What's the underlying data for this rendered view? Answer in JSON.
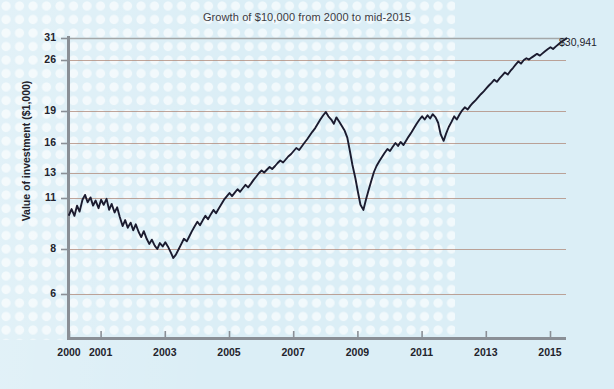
{
  "chart_data": {
    "type": "line",
    "title": "Growth of $10,000 from 2000 to mid-2015",
    "xlabel": "",
    "ylabel": "Value of investment ($1,000)",
    "grid": true,
    "legend": null,
    "xlim": [
      2000,
      2015.5
    ],
    "ylim": [
      5.2,
      31.5
    ],
    "yticks": [
      31,
      26,
      19,
      16,
      13,
      11,
      8,
      6
    ],
    "ytick_labels": [
      "31",
      "26",
      "19",
      "16",
      "13",
      "11",
      "8",
      "6"
    ],
    "xticks": [
      2000,
      2001,
      2003,
      2005,
      2007,
      2009,
      2011,
      2013,
      2015
    ],
    "xtick_labels": [
      "2000",
      "2001",
      "2003",
      "2005",
      "2007",
      "2009",
      "2011",
      "2013",
      "2015"
    ],
    "annotations": [
      {
        "text": "$30,941",
        "x": 2015.5,
        "y": 30.941
      }
    ],
    "series": [
      {
        "name": "Value of investment",
        "color": "#1b1b2f",
        "x": [
          2000.0,
          2000.08,
          2000.17,
          2000.25,
          2000.33,
          2000.42,
          2000.5,
          2000.58,
          2000.67,
          2000.75,
          2000.83,
          2000.92,
          2001.0,
          2001.08,
          2001.17,
          2001.25,
          2001.33,
          2001.42,
          2001.5,
          2001.58,
          2001.67,
          2001.75,
          2001.83,
          2001.92,
          2002.0,
          2002.08,
          2002.17,
          2002.25,
          2002.33,
          2002.42,
          2002.5,
          2002.58,
          2002.67,
          2002.75,
          2002.83,
          2002.92,
          2003.0,
          2003.08,
          2003.17,
          2003.25,
          2003.33,
          2003.42,
          2003.5,
          2003.58,
          2003.67,
          2003.75,
          2003.83,
          2003.92,
          2004.0,
          2004.08,
          2004.17,
          2004.25,
          2004.33,
          2004.42,
          2004.5,
          2004.58,
          2004.67,
          2004.75,
          2004.83,
          2004.92,
          2005.0,
          2005.08,
          2005.17,
          2005.25,
          2005.33,
          2005.42,
          2005.5,
          2005.58,
          2005.67,
          2005.75,
          2005.83,
          2005.92,
          2006.0,
          2006.08,
          2006.17,
          2006.25,
          2006.33,
          2006.42,
          2006.5,
          2006.58,
          2006.67,
          2006.75,
          2006.83,
          2006.92,
          2007.0,
          2007.08,
          2007.17,
          2007.25,
          2007.33,
          2007.42,
          2007.5,
          2007.58,
          2007.67,
          2007.75,
          2007.83,
          2007.92,
          2008.0,
          2008.08,
          2008.17,
          2008.25,
          2008.33,
          2008.42,
          2008.5,
          2008.58,
          2008.67,
          2008.75,
          2008.83,
          2008.92,
          2009.0,
          2009.08,
          2009.17,
          2009.25,
          2009.33,
          2009.42,
          2009.5,
          2009.58,
          2009.67,
          2009.75,
          2009.83,
          2009.92,
          2010.0,
          2010.08,
          2010.17,
          2010.25,
          2010.33,
          2010.42,
          2010.5,
          2010.58,
          2010.67,
          2010.75,
          2010.83,
          2010.92,
          2011.0,
          2011.08,
          2011.17,
          2011.25,
          2011.33,
          2011.42,
          2011.5,
          2011.58,
          2011.67,
          2011.75,
          2011.83,
          2011.92,
          2012.0,
          2012.08,
          2012.17,
          2012.25,
          2012.33,
          2012.42,
          2012.5,
          2012.58,
          2012.67,
          2012.75,
          2012.83,
          2012.92,
          2013.0,
          2013.08,
          2013.17,
          2013.25,
          2013.33,
          2013.42,
          2013.5,
          2013.58,
          2013.67,
          2013.75,
          2013.83,
          2013.92,
          2014.0,
          2014.08,
          2014.17,
          2014.25,
          2014.33,
          2014.42,
          2014.5,
          2014.58,
          2014.67,
          2014.75,
          2014.83,
          2014.92,
          2015.0,
          2015.08,
          2015.17,
          2015.25,
          2015.33,
          2015.42,
          2015.5
        ],
        "y": [
          10.0,
          10.35,
          9.95,
          10.55,
          10.2,
          10.9,
          11.25,
          10.75,
          11.05,
          10.55,
          10.85,
          10.4,
          10.9,
          10.6,
          10.95,
          10.3,
          10.65,
          10.15,
          10.45,
          9.9,
          9.35,
          9.7,
          9.25,
          9.55,
          9.1,
          9.45,
          9.0,
          8.7,
          9.05,
          8.6,
          8.3,
          8.55,
          8.2,
          8.0,
          8.35,
          8.15,
          8.4,
          8.15,
          7.85,
          7.6,
          7.75,
          8.0,
          8.3,
          8.6,
          8.45,
          8.75,
          9.05,
          9.35,
          9.6,
          9.4,
          9.7,
          9.95,
          9.75,
          10.05,
          10.3,
          10.1,
          10.4,
          10.65,
          10.9,
          11.15,
          11.4,
          11.15,
          11.45,
          11.7,
          11.5,
          11.8,
          12.05,
          11.85,
          12.15,
          12.45,
          12.7,
          13.0,
          13.25,
          13.05,
          13.35,
          13.6,
          13.4,
          13.7,
          14.0,
          14.25,
          14.05,
          14.35,
          14.65,
          14.9,
          15.2,
          15.5,
          15.3,
          15.65,
          16.0,
          16.35,
          16.7,
          17.05,
          17.4,
          17.8,
          18.2,
          18.6,
          18.9,
          18.5,
          18.2,
          17.8,
          18.4,
          18.0,
          17.6,
          17.2,
          16.5,
          15.2,
          13.8,
          12.6,
          11.5,
          10.6,
          10.3,
          10.9,
          11.6,
          12.4,
          13.1,
          13.7,
          14.2,
          14.6,
          15.0,
          15.4,
          15.2,
          15.6,
          16.0,
          15.7,
          16.1,
          15.8,
          16.2,
          16.6,
          17.0,
          17.4,
          17.8,
          18.2,
          18.5,
          18.2,
          18.6,
          18.3,
          18.7,
          18.4,
          17.9,
          16.8,
          16.2,
          16.9,
          17.5,
          18.0,
          18.5,
          18.2,
          18.7,
          19.1,
          19.5,
          19.2,
          19.7,
          20.1,
          20.5,
          20.9,
          21.3,
          21.7,
          22.1,
          22.5,
          22.9,
          23.3,
          23.0,
          23.5,
          23.9,
          24.3,
          24.0,
          24.5,
          24.9,
          25.4,
          25.8,
          25.5,
          26.0,
          26.4,
          26.1,
          26.6,
          27.0,
          27.4,
          27.0,
          27.5,
          28.0,
          28.5,
          28.9,
          28.5,
          29.1,
          29.6,
          30.1,
          30.5,
          30.941
        ]
      }
    ]
  },
  "labels": {
    "title": "Growth of $10,000 from 2000 to mid-2015",
    "ylabel": "Value of investment ($1,000)",
    "end_value": "$30,941"
  },
  "colors": {
    "background": "#dbeef6",
    "line": "#1b1b2f",
    "gridline": "#b08878",
    "axis": "#8a8f96",
    "text": "#23232c"
  }
}
